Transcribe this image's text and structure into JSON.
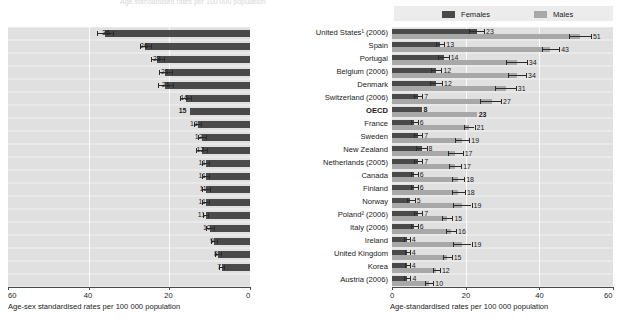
{
  "top_faint_text": "Age standardised rates per 100 000 population",
  "legend": {
    "females_label": "Females",
    "males_label": "Males",
    "females_color": "#4a4a4a",
    "males_color": "#a8a8a8"
  },
  "left_axis": {
    "title": "Age-sex standardised rates per 100 000 population",
    "ticks": [
      "60",
      "40",
      "20",
      "0"
    ],
    "max": 60,
    "reversed": true
  },
  "right_axis": {
    "title": "Age-standardised rates per 100 000 population",
    "ticks": [
      "0",
      "20",
      "40",
      "60"
    ],
    "max": 60,
    "reversed": false
  },
  "countries": [
    {
      "label": "United States¹ (2006)",
      "bold": false
    },
    {
      "label": "Spain",
      "bold": false
    },
    {
      "label": "Portugal",
      "bold": false
    },
    {
      "label": "Belgium (2006)",
      "bold": false
    },
    {
      "label": "Denmark",
      "bold": false
    },
    {
      "label": "Switzerland (2006)",
      "bold": false
    },
    {
      "label": "OECD",
      "bold": true
    },
    {
      "label": "France",
      "bold": false
    },
    {
      "label": "Sweden",
      "bold": false
    },
    {
      "label": "New Zealand",
      "bold": false
    },
    {
      "label": "Netherlands (2005)",
      "bold": false
    },
    {
      "label": "Canada",
      "bold": false
    },
    {
      "label": "Finland",
      "bold": false
    },
    {
      "label": "Norway",
      "bold": false
    },
    {
      "label": "Poland² (2006)",
      "bold": false
    },
    {
      "label": "Italy (2006)",
      "bold": false
    },
    {
      "label": "Ireland",
      "bold": false
    },
    {
      "label": "United Kingdom",
      "bold": false
    },
    {
      "label": "Korea",
      "bold": false
    },
    {
      "label": "Austria (2006)",
      "bold": false
    }
  ],
  "chart_data": [
    {
      "type": "bar",
      "id": "left-total",
      "orientation": "horizontal",
      "direction": "right-to-left",
      "title": "",
      "xlabel": "Age-sex standardised rates per 100 000 population",
      "ylabel": "",
      "xlim": [
        0,
        60
      ],
      "ticks": [
        60,
        40,
        20,
        0
      ],
      "grid": true,
      "categories": [
        "United States¹ (2006)",
        "Spain",
        "Portugal",
        "Belgium (2006)",
        "Denmark",
        "Switzerland (2006)",
        "OECD",
        "France",
        "Sweden",
        "New Zealand",
        "Netherlands (2005)",
        "Canada",
        "Finland",
        "Norway",
        "Poland² (2006)",
        "Italy (2006)",
        "Ireland",
        "United Kingdom",
        "Korea",
        "Austria (2006)"
      ],
      "values": [
        36,
        26,
        23,
        21,
        21,
        16,
        15,
        13,
        12,
        12,
        11,
        11,
        11,
        11,
        11,
        10,
        9,
        8,
        7,
        null
      ],
      "labels": [
        "36",
        "26",
        "23",
        "21",
        "21",
        "16",
        "15",
        "13",
        "12",
        "12",
        "11",
        "11",
        "11",
        "11",
        "11",
        "10",
        "9",
        "8",
        "7",
        ""
      ],
      "error_low": [
        34.0,
        24.6,
        21.4,
        19.4,
        19.2,
        14.6,
        null,
        12.2,
        11.0,
        10.6,
        10.2,
        10.2,
        10.0,
        10.2,
        10.4,
        9.0,
        8.2,
        7.2,
        6.4,
        null
      ],
      "error_high": [
        38.0,
        27.4,
        24.6,
        22.6,
        22.8,
        17.4,
        null,
        13.8,
        13.0,
        13.4,
        11.8,
        11.8,
        12.0,
        11.8,
        11.6,
        11.0,
        9.8,
        8.8,
        7.6,
        null
      ],
      "series_name": "Total (age-sex standardised)",
      "color": "#4a4a4a"
    },
    {
      "type": "bar",
      "id": "right-by-sex",
      "orientation": "horizontal",
      "direction": "left-to-right",
      "title": "",
      "xlabel": "Age-standardised rates per 100 000 population",
      "ylabel": "",
      "xlim": [
        0,
        60
      ],
      "ticks": [
        0,
        20,
        40,
        60
      ],
      "grid": true,
      "legend_position": "top",
      "categories": [
        "United States¹ (2006)",
        "Spain",
        "Portugal",
        "Belgium (2006)",
        "Denmark",
        "Switzerland (2006)",
        "OECD",
        "France",
        "Sweden",
        "New Zealand",
        "Netherlands (2005)",
        "Canada",
        "Finland",
        "Norway",
        "Poland² (2006)",
        "Italy (2006)",
        "Ireland",
        "United Kingdom",
        "Korea",
        "Austria (2006)"
      ],
      "series": [
        {
          "name": "Females",
          "color": "#4a4a4a",
          "values": [
            23,
            13,
            14,
            12,
            12,
            7,
            8,
            6,
            7,
            8,
            7,
            6,
            6,
            5,
            7,
            6,
            4,
            4,
            4,
            4
          ],
          "labels": [
            "23",
            "13",
            "14",
            "12",
            "12",
            "7",
            "8",
            "6",
            "7",
            "8",
            "7",
            "6",
            "6",
            "5",
            "7",
            "6",
            "4",
            "4",
            "4",
            "4"
          ],
          "bold_label_index": 6,
          "error_low": [
            21.0,
            12.0,
            12.6,
            10.6,
            10.4,
            6.0,
            null,
            5.2,
            6.0,
            6.6,
            6.0,
            5.2,
            5.2,
            4.0,
            6.0,
            5.2,
            3.2,
            3.4,
            3.4,
            3.2
          ],
          "error_high": [
            25.0,
            14.2,
            15.4,
            13.4,
            13.6,
            8.2,
            null,
            7.0,
            8.2,
            9.4,
            8.2,
            7.0,
            7.0,
            6.2,
            8.2,
            7.0,
            4.8,
            4.8,
            4.8,
            5.0
          ]
        },
        {
          "name": "Males",
          "color": "#a8a8a8",
          "values": [
            51,
            43,
            34,
            34,
            31,
            27,
            23,
            21,
            19,
            17,
            17,
            18,
            18,
            19,
            15,
            16,
            19,
            15,
            12,
            10
          ],
          "labels": [
            "51",
            "43",
            "34",
            "34",
            "31",
            "27",
            "23",
            "21",
            "19",
            "17",
            "17",
            "18",
            "18",
            "19",
            "15",
            "16",
            "19",
            "15",
            "12",
            "10"
          ],
          "bold_label_index": 6,
          "error_low": [
            48.0,
            40.6,
            31.0,
            31.4,
            28.0,
            24.0,
            null,
            19.6,
            17.0,
            15.2,
            15.4,
            16.4,
            16.2,
            16.6,
            13.6,
            14.6,
            16.6,
            13.8,
            11.0,
            9.0
          ],
          "error_high": [
            54.0,
            45.4,
            36.6,
            36.4,
            33.6,
            29.6,
            null,
            22.4,
            21.0,
            19.2,
            18.8,
            19.6,
            19.8,
            21.6,
            16.4,
            17.4,
            21.6,
            16.2,
            13.0,
            11.2
          ]
        }
      ]
    }
  ]
}
